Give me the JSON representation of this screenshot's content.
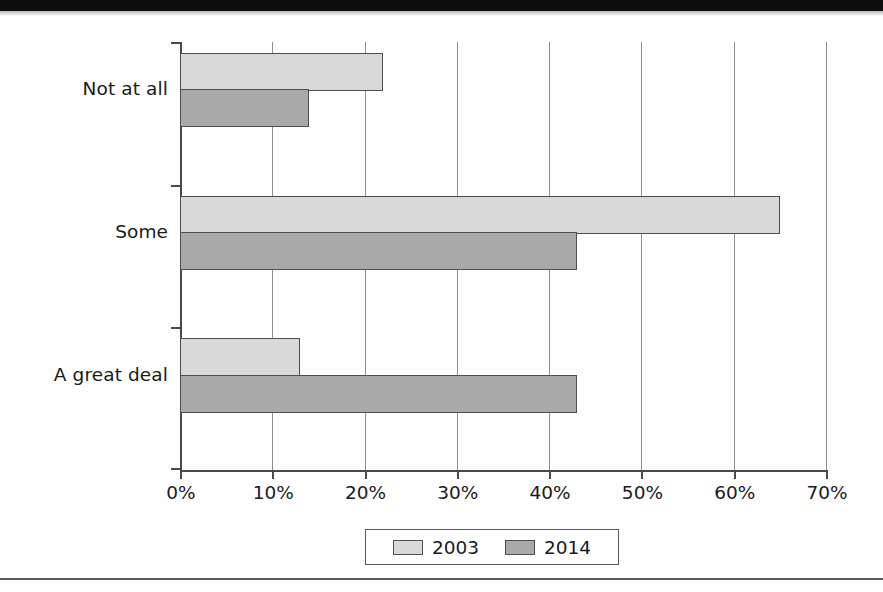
{
  "chart_data": {
    "type": "bar",
    "orientation": "horizontal",
    "title": "",
    "subtitle": "",
    "xlabel": "",
    "ylabel": "",
    "categories": [
      "Not at all",
      "Some",
      "A great deal"
    ],
    "series": [
      {
        "name": "2003",
        "values": [
          22,
          65,
          13
        ],
        "color": "#d9d9d9"
      },
      {
        "name": "2014",
        "values": [
          14,
          43,
          43
        ],
        "color": "#a9a9a9"
      }
    ],
    "xlim": [
      0,
      70
    ],
    "xticks": [
      0,
      10,
      20,
      30,
      40,
      50,
      60,
      70
    ],
    "xtick_labels": [
      "0%",
      "10%",
      "20%",
      "30%",
      "40%",
      "50%",
      "60%",
      "70%"
    ],
    "grid": "vertical",
    "legend_position": "bottom",
    "value_format": "percent"
  },
  "legend": {
    "items": [
      {
        "label": "2003",
        "swatch": "legend-swatch-2003"
      },
      {
        "label": "2014",
        "swatch": "legend-swatch-2014"
      }
    ]
  },
  "colors": {
    "series_2003": "#d9d9d9",
    "series_2014": "#a9a9a9",
    "bar_border": "#4e4e4e",
    "axis": "#4a4a4a",
    "gridline": "#8f8f8f",
    "text": "#1a1a1a",
    "background": "#fefefe",
    "top_band": "#0d0d0d"
  }
}
